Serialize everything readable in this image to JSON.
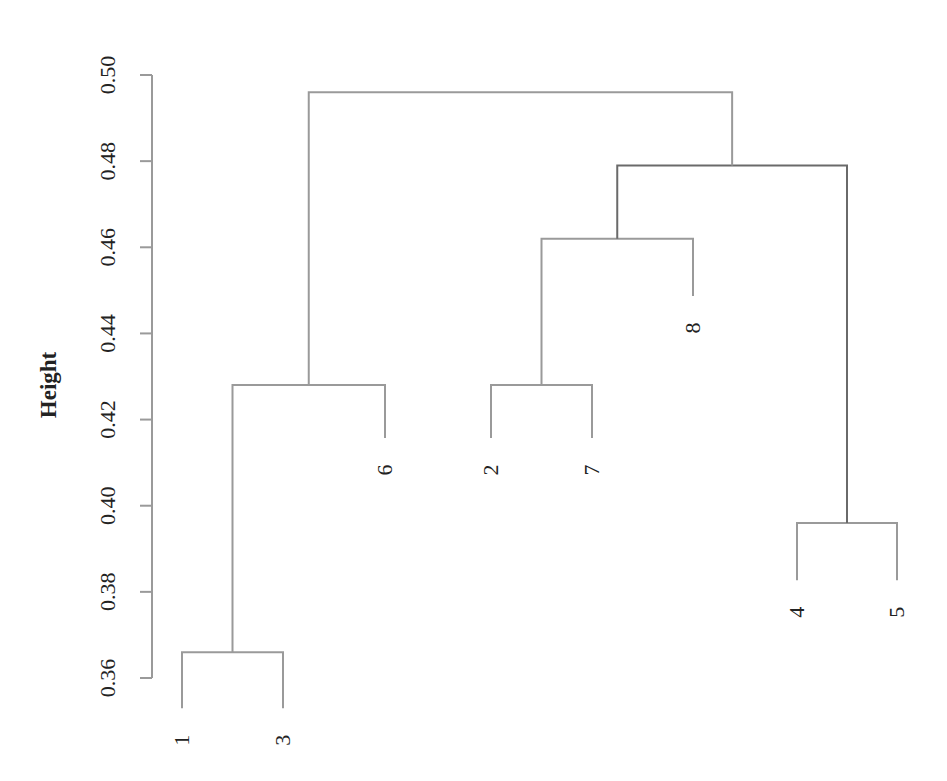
{
  "chart_data": {
    "type": "dendrogram",
    "title": "",
    "xlabel": "",
    "ylabel": "Height",
    "ylim": [
      0.36,
      0.5
    ],
    "yticks": [
      "0.36",
      "0.38",
      "0.40",
      "0.42",
      "0.44",
      "0.46",
      "0.48",
      "0.50"
    ],
    "grid": false,
    "leaf_order": [
      "1",
      "3",
      "6",
      "2",
      "7",
      "8",
      "4",
      "5"
    ],
    "merges": [
      {
        "left": "1",
        "right": "3",
        "height": 0.366
      },
      {
        "left": "4",
        "right": "5",
        "height": 0.396
      },
      {
        "left": "2",
        "right": "7",
        "height": 0.428
      },
      {
        "left": "(1,3)",
        "right": "6",
        "height": 0.428
      },
      {
        "left": "(2,7)",
        "right": "8",
        "height": 0.462
      },
      {
        "left": "((2,7),8)",
        "right": "(4,5)",
        "height": 0.479
      },
      {
        "left": "((1,3),6)",
        "right": "(((2,7),8),(4,5))",
        "height": 0.496
      }
    ],
    "line_color": "#9a9a9a"
  }
}
